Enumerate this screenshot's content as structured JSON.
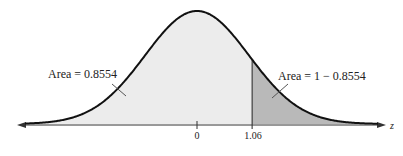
{
  "chart_data": {
    "type": "area",
    "title": "",
    "xlabel": "z",
    "ticks": [
      {
        "value": 0,
        "label": "0"
      },
      {
        "value": 1.06,
        "label": "1.06"
      }
    ],
    "regions": [
      {
        "name": "left",
        "from": "-inf",
        "to": 1.06,
        "label": "Area = 0.8554",
        "color": "#ececec"
      },
      {
        "name": "right",
        "from": 1.06,
        "to": "inf",
        "label": "Area = 1 − 0.8554",
        "color": "#b8b8b8"
      }
    ],
    "mean": 0,
    "sd": 1
  },
  "labels": {
    "left_area": "Area = 0.8554",
    "right_area": "Area = 1 − 0.8554",
    "tick_zero": "0",
    "tick_z": "1.06",
    "axis_name": "z"
  }
}
